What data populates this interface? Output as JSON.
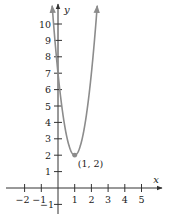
{
  "chart_data": {
    "type": "line",
    "title": "",
    "xlabel": "x",
    "ylabel": "y",
    "xlim": [
      -2.5,
      6
    ],
    "ylim": [
      -1.3,
      11.3
    ],
    "grid": false,
    "function": "y = 5(x - 1)^2 + 2",
    "x_ticks": [
      -2,
      -1,
      1,
      2,
      3,
      4,
      5
    ],
    "x_tick_labels": [
      "−2",
      "−1",
      "1",
      "2",
      "3",
      "4",
      "5"
    ],
    "y_ticks": [
      -1,
      1,
      2,
      3,
      4,
      5,
      6,
      7,
      8,
      9,
      10
    ],
    "y_tick_labels": [
      "−1",
      "1",
      "2",
      "3",
      "4",
      "5",
      "6",
      "7",
      "8",
      "9",
      "10"
    ],
    "series": [
      {
        "name": "parabola",
        "color": "#8c8c8c",
        "x": [
          -0.35,
          -0.2,
          0,
          0.25,
          0.5,
          0.75,
          1,
          1.25,
          1.5,
          1.75,
          2,
          2.2,
          2.35
        ],
        "values": [
          11.11,
          9.2,
          7,
          4.81,
          3.25,
          2.31,
          2,
          2.31,
          3.25,
          4.81,
          7,
          9.2,
          11.11
        ],
        "arrows_at_ends": true
      }
    ],
    "annotations": [
      {
        "point": [
          1,
          2
        ],
        "label": "(1, 2)",
        "marker": "dot"
      }
    ],
    "axis_color": "#333333"
  }
}
